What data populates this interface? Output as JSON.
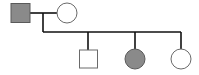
{
  "diagram": {
    "type": "pedigree",
    "title": "Family pedigree chart",
    "colors": {
      "line": "#111111",
      "affected_fill": "#8a8a8a",
      "affected_stroke": "#5a5a5a",
      "unaffected_fill": "#ffffff",
      "unaffected_stroke": "#6a6a6a"
    },
    "generations": [
      {
        "label": "Generation I",
        "individuals": [
          {
            "id": "I-1",
            "sex": "male",
            "shape": "square",
            "affected": true,
            "label": "Father (affected)"
          },
          {
            "id": "I-2",
            "sex": "female",
            "shape": "circle",
            "affected": false,
            "label": "Mother (unaffected)"
          }
        ]
      },
      {
        "label": "Generation II",
        "individuals": [
          {
            "id": "II-1",
            "sex": "male",
            "shape": "square",
            "affected": false,
            "label": "Son (unaffected)"
          },
          {
            "id": "II-2",
            "sex": "female",
            "shape": "circle",
            "affected": true,
            "label": "Daughter (affected)"
          },
          {
            "id": "II-3",
            "sex": "female",
            "shape": "circle",
            "affected": false,
            "label": "Daughter (unaffected)"
          }
        ]
      }
    ]
  }
}
